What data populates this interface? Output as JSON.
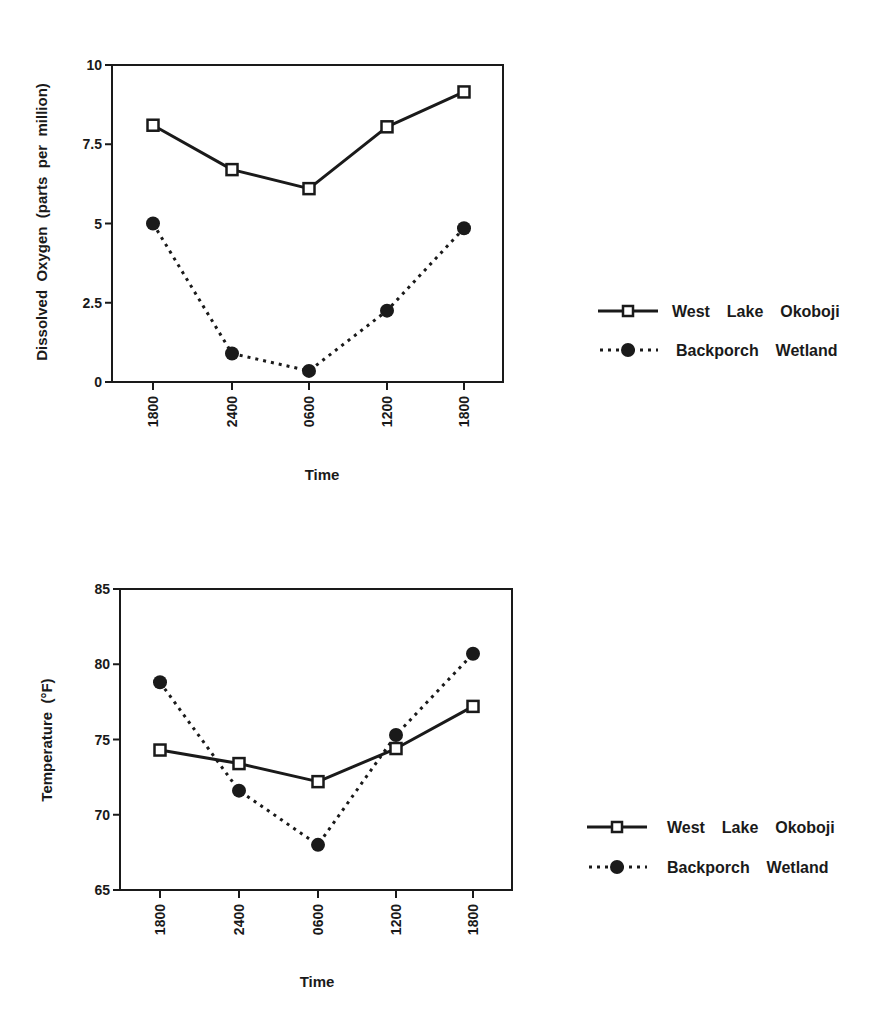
{
  "chart_data": [
    {
      "type": "line",
      "title": "",
      "xlabel": "Time",
      "ylabel": "Dissolved Oxygen (parts per million)",
      "categories": [
        "1800",
        "2400",
        "0600",
        "1200",
        "1800"
      ],
      "ylim": [
        0,
        10
      ],
      "yticks": [
        "0",
        "2.5",
        "5",
        "7.5",
        "10"
      ],
      "ytick_values": [
        0,
        2.5,
        5,
        7.5,
        10
      ],
      "grid": false,
      "legend_position": "right",
      "series": [
        {
          "name": "West Lake Okoboji",
          "marker": "open-square",
          "line": "solid",
          "values": [
            8.1,
            6.7,
            6.1,
            8.05,
            9.15
          ]
        },
        {
          "name": "Backporch Wetland",
          "marker": "filled-circle",
          "line": "dotted",
          "values": [
            5.0,
            0.9,
            0.35,
            2.25,
            4.85
          ]
        }
      ]
    },
    {
      "type": "line",
      "title": "",
      "xlabel": "Time",
      "ylabel": "Temperature (°F)",
      "categories": [
        "1800",
        "2400",
        "0600",
        "1200",
        "1800"
      ],
      "ylim": [
        65,
        85
      ],
      "yticks": [
        "65",
        "70",
        "75",
        "80",
        "85"
      ],
      "ytick_values": [
        65,
        70,
        75,
        80,
        85
      ],
      "grid": false,
      "legend_position": "right",
      "series": [
        {
          "name": "West Lake Okoboji",
          "marker": "open-square",
          "line": "solid",
          "values": [
            74.3,
            73.4,
            72.2,
            74.4,
            77.2
          ]
        },
        {
          "name": "Backporch Wetland",
          "marker": "filled-circle",
          "line": "dotted",
          "values": [
            78.8,
            71.6,
            68.0,
            75.3,
            80.7
          ]
        }
      ]
    }
  ],
  "charts": {
    "oxygen": {
      "ylabel": "Dissolved  Oxygen  (parts  per  million)",
      "xlabel": "Time",
      "legend": [
        "West  Lake  Okoboji",
        "Backporch  Wetland"
      ]
    },
    "temperature": {
      "ylabel": "Temperature  (°F)",
      "xlabel": "Time",
      "legend": [
        "West  Lake  Okoboji",
        "Backporch  Wetland"
      ]
    }
  },
  "colors": {
    "ink": "#1a1a1a",
    "background": "#ffffff"
  }
}
